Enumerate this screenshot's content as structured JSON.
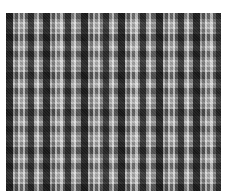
{
  "image": {
    "subject": "black, gray and white tartan plaid fabric pattern",
    "colors": {
      "background": "#ffffff",
      "dark_band": "#141414",
      "mid_gray": "#9a9a9a",
      "light_stripe": "#ebebeb"
    },
    "pattern_period_px": 37.5
  }
}
